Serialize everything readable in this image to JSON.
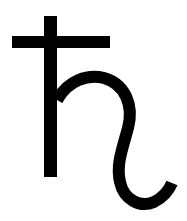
{
  "symbol": {
    "name": "Saturn symbol",
    "glyph": "♄",
    "color": "#000000",
    "background": "#ffffff"
  }
}
